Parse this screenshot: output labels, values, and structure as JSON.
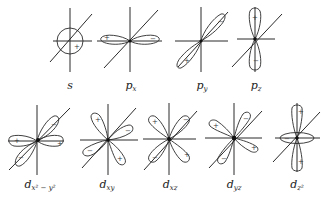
{
  "figure": {
    "rows": [
      {
        "orbitals": [
          {
            "id": "s",
            "label_main": "s",
            "label_sub": "",
            "signs": [
              "+"
            ]
          },
          {
            "id": "px",
            "label_main": "p",
            "label_sub": "x",
            "signs": [
              "+",
              "−"
            ]
          },
          {
            "id": "py",
            "label_main": "p",
            "label_sub": "y",
            "signs": [
              "−",
              "+"
            ]
          },
          {
            "id": "pz",
            "label_main": "p",
            "label_sub": "z",
            "signs": [
              "+",
              "−"
            ]
          }
        ]
      },
      {
        "orbitals": [
          {
            "id": "dx2y2",
            "label_main": "d",
            "label_sub": "x² − y²",
            "signs": [
              "+",
              "−",
              "+",
              "−"
            ]
          },
          {
            "id": "dxy",
            "label_main": "d",
            "label_sub": "xy",
            "signs": [
              "+",
              "−",
              "−",
              "+"
            ]
          },
          {
            "id": "dxz",
            "label_main": "d",
            "label_sub": "xz",
            "signs": [
              "+",
              "−",
              "−",
              "+"
            ]
          },
          {
            "id": "dyz",
            "label_main": "d",
            "label_sub": "yz",
            "signs": [
              "+",
              "−",
              "+",
              "−"
            ]
          },
          {
            "id": "dz2",
            "label_main": "d",
            "label_sub": "z²",
            "signs": [
              "+",
              "−",
              "+"
            ]
          }
        ]
      }
    ]
  }
}
